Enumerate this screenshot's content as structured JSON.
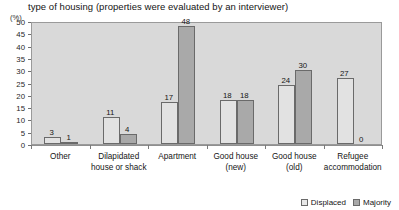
{
  "chart_data": {
    "type": "bar",
    "title": "type of housing (properties were evaluated by an interviewer)",
    "xlabel": "",
    "ylabel": "(%)",
    "ylim": [
      0,
      50
    ],
    "yticks": [
      0,
      5,
      10,
      15,
      20,
      25,
      30,
      35,
      40,
      45,
      50
    ],
    "grid": false,
    "legend_position": "bottom-right",
    "categories": [
      "Other",
      "Dilapidated house or shack",
      "Apartment",
      "Good house (new)",
      "Good house (old)",
      "Refugee accommodation"
    ],
    "category_lines": [
      [
        "Other"
      ],
      [
        "Dilapidated",
        "house or shack"
      ],
      [
        "Apartment"
      ],
      [
        "Good house",
        "(new)"
      ],
      [
        "Good house",
        "(old)"
      ],
      [
        "Refugee",
        "accommodation"
      ]
    ],
    "series": [
      {
        "name": "Displaced",
        "color": "#e2e2e2",
        "values": [
          3,
          11,
          17,
          18,
          24,
          27
        ]
      },
      {
        "name": "Majority",
        "color": "#a9a9a9",
        "values": [
          1,
          4,
          48,
          18,
          30,
          0
        ]
      }
    ]
  },
  "legend": {
    "items": [
      {
        "label": "Displaced",
        "swatch": "displaced"
      },
      {
        "label": "Majority",
        "swatch": "majority"
      }
    ]
  },
  "colors": {
    "plot_background": "#d9d9d9",
    "plot_border": "#9a9a9a",
    "displaced_fill": "#e2e2e2",
    "majority_fill": "#a9a9a9",
    "bar_outline": "#6a6a6a",
    "text": "#151515"
  }
}
